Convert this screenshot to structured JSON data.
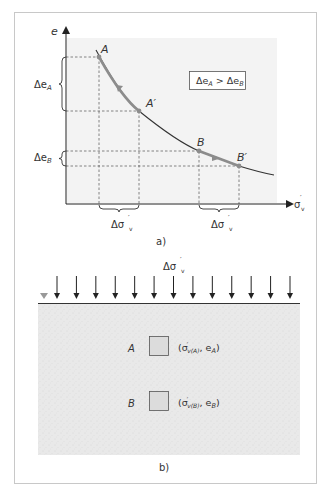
{
  "figure": {
    "panel_a": {
      "caption": "a)",
      "y_axis_label": "e",
      "x_axis_label_main": "σ",
      "x_axis_label_prime": "′",
      "x_axis_label_sub": "v",
      "inequality": {
        "lhs": "Δe",
        "lhs_sub": "A",
        "op": " > ",
        "rhs": "Δe",
        "rhs_sub": "B"
      },
      "points": [
        {
          "id": "A",
          "label": "A"
        },
        {
          "id": "A_prime",
          "label": "A′"
        },
        {
          "id": "B",
          "label": "B"
        },
        {
          "id": "B_prime",
          "label": "B′"
        }
      ],
      "delta_e_labels": [
        {
          "main": "Δe",
          "sub": "A"
        },
        {
          "main": "Δe",
          "sub": "B"
        }
      ],
      "delta_sigma_labels": [
        {
          "main": "Δσ",
          "prime": "′",
          "sub": "v"
        },
        {
          "main": "Δσ",
          "prime": "′",
          "sub": "v"
        }
      ],
      "colors": {
        "curve": "#333333",
        "path_highlight": "#8c8c8c",
        "point": "#8c8c8c",
        "plot_bg": "#f2f2f2",
        "guide_lines": "#555555"
      }
    },
    "panel_b": {
      "caption": "b)",
      "load_label": {
        "main": "Δσ",
        "prime": "′",
        "sub": "v"
      },
      "load_arrow_count": 13,
      "elements": [
        {
          "label": "A",
          "coord_open": "(σ",
          "coord_prime": "′",
          "coord_sub": "v(A)",
          "coord_mid": ", e",
          "coord_e_sub": "A",
          "coord_close": ")"
        },
        {
          "label": "B",
          "coord_open": "(σ",
          "coord_prime": "′",
          "coord_sub": "v(B)",
          "coord_mid": ", e",
          "coord_e_sub": "B",
          "coord_close": ")"
        }
      ],
      "colors": {
        "soil": "#e8e8e8",
        "element_fill": "#dcdcdc",
        "water_table": "#999999"
      }
    }
  }
}
